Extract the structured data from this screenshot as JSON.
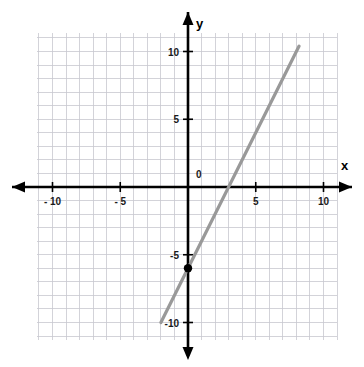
{
  "chart_data": {
    "type": "line",
    "title": "",
    "xlabel": "x",
    "ylabel": "y",
    "xlim": [
      -11,
      11
    ],
    "ylim": [
      -11,
      11
    ],
    "grid": true,
    "grid_step": 1,
    "legend": "none",
    "origin_label": "0",
    "x_ticks": [
      -10,
      -5,
      5,
      10
    ],
    "x_tick_labels": [
      "- 10",
      "- 5",
      "5",
      "10"
    ],
    "y_ticks": [
      10,
      5,
      -5,
      -10
    ],
    "y_tick_labels": [
      "10",
      "5",
      "-5",
      "-10"
    ],
    "series": [
      {
        "name": "line",
        "type": "line",
        "equation": "y = 2x - 6",
        "slope": 2,
        "y_intercept": -6,
        "x_intercept": 3,
        "color": "#999999",
        "x_start": -2,
        "y_start": -10,
        "x_end": 8.2,
        "y_end": 10.4
      }
    ],
    "points": [
      {
        "name": "y-intercept-point",
        "x": 0,
        "y": -6,
        "color": "#000000"
      }
    ],
    "colors": {
      "axis": "#000000",
      "grid": "#c8c8cf",
      "line": "#999999",
      "point": "#000000",
      "background": "#ffffff"
    }
  },
  "axes": {
    "x_axis_name": "x",
    "y_axis_name": "y"
  }
}
